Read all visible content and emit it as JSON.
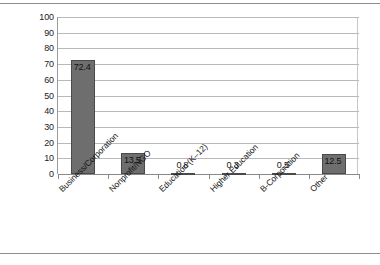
{
  "chart_data": {
    "type": "bar",
    "title": "",
    "subtitle": "",
    "xlabel": "",
    "ylabel": "",
    "ylim": [
      0,
      100
    ],
    "ytick_step": 10,
    "yticks": [
      "100",
      "90",
      "80",
      "70",
      "60",
      "50",
      "40",
      "30",
      "20",
      "10",
      "0"
    ],
    "grid": true,
    "legend": false,
    "legend_position": "none",
    "orientation": "vertical",
    "categories": [
      "Business/Corporation",
      "Nonprofit/NGO",
      "Education (K–12)",
      "Higher Education",
      "B-Corporation",
      "Other"
    ],
    "values": [
      72.4,
      13.5,
      0.8,
      0.3,
      0.5,
      12.5
    ],
    "value_labels": [
      "72.4",
      "13.5",
      "0.8",
      "0.3",
      "0.5",
      "12.5"
    ],
    "label_placement": [
      "inside",
      "inside",
      "above",
      "above",
      "above",
      "inside"
    ],
    "series": [
      {
        "name": "",
        "values": [
          72.4,
          13.5,
          0.8,
          0.3,
          0.5,
          12.5
        ]
      }
    ],
    "colors": {
      "bar_fill": "#6e6e6e",
      "bar_stroke": "#4a4a4a",
      "gridline": "#b9b9b9",
      "axis": "#8a8a8a",
      "text": "#1b1b1b",
      "background": "#ffffff",
      "scan_rule": "#8e8e8e"
    }
  }
}
